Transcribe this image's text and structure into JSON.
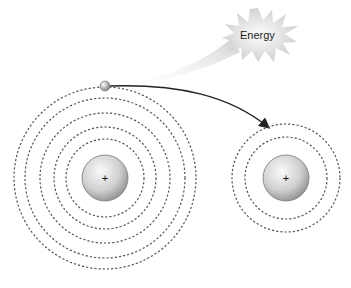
{
  "diagram": {
    "energy_label": "Energy",
    "colors": {
      "orbit": "#555555",
      "nucleus_light": "#f4f4f4",
      "nucleus_dark": "#9a9a9a",
      "arrow": "#222222",
      "burst": "#d6d6d6",
      "wedge": "#dcdcdc"
    },
    "atoms": [
      {
        "name": "initial-atom",
        "center": [
          105,
          178
        ],
        "nucleus_radius": 23,
        "nucleus_symbol": "+",
        "orbit_radii": [
          39,
          51,
          65,
          80,
          91
        ]
      },
      {
        "name": "final-atom",
        "center": [
          286,
          178
        ],
        "nucleus_radius": 23,
        "nucleus_symbol": "+",
        "orbit_radii": [
          41,
          54
        ]
      }
    ],
    "electron": {
      "position": [
        105,
        86
      ],
      "radius": 5
    },
    "transition_arrow": {
      "from": [
        110,
        86
      ],
      "to": [
        268,
        128
      ]
    }
  }
}
